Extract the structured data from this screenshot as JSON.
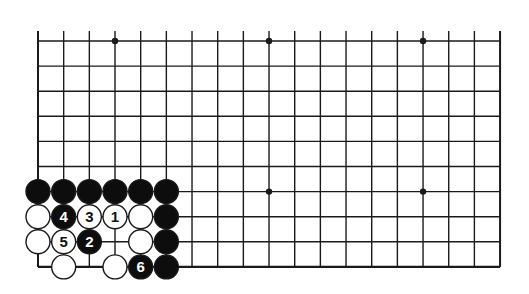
{
  "diagram": {
    "type": "go-board-partial",
    "columns": 19,
    "rows_visible": 10,
    "open_edges": [
      "top"
    ],
    "grid": {
      "x_start": 38,
      "x_step": 25.67,
      "y_start": 41,
      "y_step": 25.1,
      "line_color": "#1a1a1a"
    },
    "star_points": [
      {
        "col": 3,
        "row": 0
      },
      {
        "col": 9,
        "row": 0
      },
      {
        "col": 15,
        "row": 0
      },
      {
        "col": 9,
        "row": 6
      },
      {
        "col": 15,
        "row": 6
      }
    ],
    "stones": [
      {
        "col": 0,
        "row": 6,
        "color": "black",
        "label": ""
      },
      {
        "col": 1,
        "row": 6,
        "color": "black",
        "label": ""
      },
      {
        "col": 2,
        "row": 6,
        "color": "black",
        "label": ""
      },
      {
        "col": 3,
        "row": 6,
        "color": "black",
        "label": ""
      },
      {
        "col": 4,
        "row": 6,
        "color": "black",
        "label": ""
      },
      {
        "col": 5,
        "row": 6,
        "color": "black",
        "label": ""
      },
      {
        "col": 0,
        "row": 7,
        "color": "white",
        "label": ""
      },
      {
        "col": 1,
        "row": 7,
        "color": "black",
        "label": "4"
      },
      {
        "col": 2,
        "row": 7,
        "color": "white",
        "label": "3"
      },
      {
        "col": 3,
        "row": 7,
        "color": "white",
        "label": "1"
      },
      {
        "col": 4,
        "row": 7,
        "color": "white",
        "label": ""
      },
      {
        "col": 5,
        "row": 7,
        "color": "black",
        "label": ""
      },
      {
        "col": 0,
        "row": 8,
        "color": "white",
        "label": ""
      },
      {
        "col": 1,
        "row": 8,
        "color": "white",
        "label": "5"
      },
      {
        "col": 2,
        "row": 8,
        "color": "black",
        "label": "2"
      },
      {
        "col": 4,
        "row": 8,
        "color": "white",
        "label": ""
      },
      {
        "col": 5,
        "row": 8,
        "color": "black",
        "label": ""
      },
      {
        "col": 1,
        "row": 9,
        "color": "white",
        "label": ""
      },
      {
        "col": 3,
        "row": 9,
        "color": "white",
        "label": ""
      },
      {
        "col": 4,
        "row": 9,
        "color": "black",
        "label": "6"
      },
      {
        "col": 5,
        "row": 9,
        "color": "black",
        "label": ""
      }
    ],
    "colors": {
      "black_stone": "#0d0d0d",
      "white_stone": "#ffffff",
      "stone_outline": "#1a1a1a",
      "black_label": "#ffffff",
      "white_label": "#111111"
    }
  }
}
